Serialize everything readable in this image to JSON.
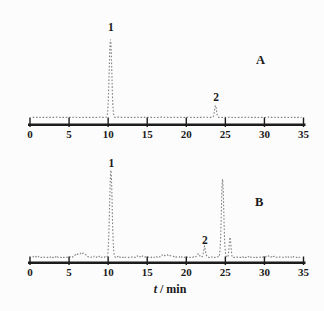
{
  "figure": {
    "x_axis_title_parts": [
      {
        "text": "t",
        "italic": true
      },
      {
        "text": " / min",
        "italic": false
      }
    ]
  },
  "style": {
    "background": "#fcfcfc",
    "trace_color": "#818181",
    "axis_color": "#1c1c1c",
    "text_color": "#1a1a1a"
  },
  "chart_data": [
    {
      "type": "line",
      "panel": "A",
      "xlabel": "",
      "xlim": [
        0,
        35
      ],
      "xticks": [
        0,
        5,
        10,
        15,
        20,
        25,
        30,
        35
      ],
      "tick_labels": [
        "0",
        "5",
        "10",
        "15",
        "20",
        "25",
        "30",
        "35"
      ],
      "peaks": [
        {
          "t": 10.3,
          "height_px": 78,
          "sigma": 0.16,
          "label": "1",
          "label_y": 31
        },
        {
          "t": 23.74,
          "height_px": 12,
          "sigma": 0.12,
          "label": "2",
          "label_y": 101
        }
      ],
      "annotation": {
        "text": "A",
        "x_px": 256,
        "y_px": 64
      },
      "show_xlabel": false,
      "layout": {
        "x_start": 30,
        "x_end": 303.5,
        "baseline_y": 117.5,
        "axis_y": 124.7,
        "tick_top": 117.5,
        "tick_bottom": 127,
        "tick_label_y": 138,
        "noise_amp": 0.25,
        "trace_t_min": 0.35,
        "trace_t_max": 34.8
      }
    },
    {
      "type": "line",
      "panel": "B",
      "xlabel": "t / min",
      "xlim": [
        0,
        35
      ],
      "xticks": [
        0,
        5,
        10,
        15,
        20,
        25,
        30,
        35
      ],
      "tick_labels": [
        "0",
        "5",
        "10",
        "15",
        "20",
        "25",
        "30",
        "35"
      ],
      "peaks": [
        {
          "t": 6.1,
          "height_px": 2.5,
          "sigma": 0.25
        },
        {
          "t": 6.8,
          "height_px": 4,
          "sigma": 0.35
        },
        {
          "t": 10.35,
          "height_px": 87,
          "sigma": 0.16,
          "label": "1",
          "label_y": 167
        },
        {
          "t": 17.6,
          "height_px": 2,
          "sigma": 0.6
        },
        {
          "t": 21.5,
          "height_px": 3.5,
          "sigma": 0.15
        },
        {
          "t": 22.33,
          "height_px": 10,
          "sigma": 0.12,
          "label": "2",
          "label_y": 244
        },
        {
          "t": 24.64,
          "height_px": 78,
          "sigma": 0.15
        },
        {
          "t": 25.6,
          "height_px": 20,
          "sigma": 0.11
        }
      ],
      "annotation": {
        "text": "B",
        "x_px": 255,
        "y_px": 206
      },
      "show_xlabel": true,
      "xlabel_x": 170,
      "xlabel_y": 293,
      "layout": {
        "x_start": 30,
        "x_end": 303.5,
        "baseline_y": 257.5,
        "axis_y": 262.7,
        "tick_top": 256.5,
        "tick_bottom": 265,
        "tick_label_y": 276,
        "noise_amp": 1.0,
        "trace_t_min": 0.35,
        "trace_t_max": 34.8
      }
    }
  ]
}
